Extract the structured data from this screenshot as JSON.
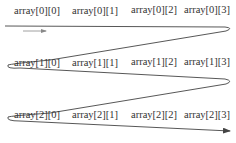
{
  "diagram": {
    "rows": [
      {
        "cells": [
          "array[0][0]",
          "array[0][1]",
          "array[0][2]",
          "array[0][3]"
        ]
      },
      {
        "cells": [
          "array[1][0]",
          "array[1][1]",
          "array[1][2]",
          "array[1][3]"
        ]
      },
      {
        "cells": [
          "array[2][0]",
          "array[2][1]",
          "array[2][2]",
          "array[2][3]"
        ]
      }
    ],
    "colors": {
      "text": "#333333",
      "path": "#444444"
    },
    "icons": {
      "direction_arrow": "arrow-right-icon",
      "path_end_arrow": "arrowhead-icon"
    }
  }
}
